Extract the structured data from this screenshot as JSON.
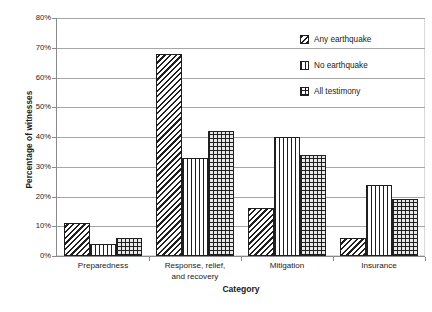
{
  "chart_data": {
    "type": "bar",
    "title": "",
    "xlabel": "Category",
    "ylabel": "Percentage of witnesses",
    "ylim": [
      0,
      80
    ],
    "ytick_step": 10,
    "ytick_labels": [
      "0%",
      "10%",
      "20%",
      "30%",
      "40%",
      "50%",
      "60%",
      "70%",
      "80%"
    ],
    "ytick_values": [
      0,
      10,
      20,
      30,
      40,
      50,
      60,
      70,
      80
    ],
    "grid": "horizontal",
    "legend_position": "top-right",
    "categories": [
      "Preparedness",
      "Response, relief, and recovery",
      "Mitigation",
      "Insurance"
    ],
    "category_lines": [
      [
        "Preparedness"
      ],
      [
        "Response, relief,",
        "and recovery"
      ],
      [
        "Mitigation"
      ],
      [
        "Insurance"
      ]
    ],
    "series": [
      {
        "name": "Any earthquake",
        "pattern": "diagonal-hatch",
        "values": [
          11,
          68,
          16,
          6
        ]
      },
      {
        "name": "No earthquake",
        "pattern": "vertical-lines",
        "values": [
          4,
          33,
          40,
          24
        ]
      },
      {
        "name": "All testimony",
        "pattern": "brick-grid",
        "values": [
          6,
          42,
          34,
          19
        ]
      }
    ]
  },
  "colors": {
    "ink": "#1f1f1f",
    "gridline": "#a6a6a6",
    "axis": "#8a8a8a",
    "frame": "#d9d9d9",
    "background": "#ffffff"
  }
}
